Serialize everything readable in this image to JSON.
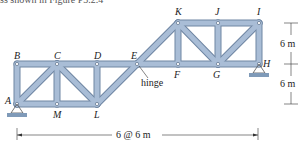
{
  "caption": "ss shown in Figure P3.2.4",
  "nodes": [
    {
      "id": "A",
      "x": 17,
      "y": 104
    },
    {
      "id": "B",
      "x": 17,
      "y": 64
    },
    {
      "id": "C",
      "x": 57,
      "y": 64
    },
    {
      "id": "D",
      "x": 97,
      "y": 64
    },
    {
      "id": "E",
      "x": 137,
      "y": 64
    },
    {
      "id": "F",
      "x": 178,
      "y": 64
    },
    {
      "id": "G",
      "x": 218,
      "y": 64
    },
    {
      "id": "H",
      "x": 259,
      "y": 64
    },
    {
      "id": "I",
      "x": 259,
      "y": 23
    },
    {
      "id": "J",
      "x": 218,
      "y": 23
    },
    {
      "id": "K",
      "x": 178,
      "y": 23
    },
    {
      "id": "L",
      "x": 97,
      "y": 104
    },
    {
      "id": "M",
      "x": 57,
      "y": 104
    }
  ],
  "members": [
    [
      "A",
      "B"
    ],
    [
      "B",
      "C"
    ],
    [
      "C",
      "D"
    ],
    [
      "D",
      "E"
    ],
    [
      "A",
      "M"
    ],
    [
      "M",
      "L"
    ],
    [
      "A",
      "C"
    ],
    [
      "C",
      "M"
    ],
    [
      "C",
      "L"
    ],
    [
      "D",
      "L"
    ],
    [
      "L",
      "E"
    ],
    [
      "E",
      "K"
    ],
    [
      "E",
      "F"
    ],
    [
      "F",
      "G"
    ],
    [
      "G",
      "H"
    ],
    [
      "K",
      "J"
    ],
    [
      "J",
      "I"
    ],
    [
      "K",
      "F"
    ],
    [
      "K",
      "G"
    ],
    [
      "J",
      "G"
    ],
    [
      "G",
      "I"
    ],
    [
      "I",
      "H"
    ]
  ],
  "labels": {
    "A": "A",
    "B": "B",
    "C": "C",
    "D": "D",
    "E": "E",
    "F": "F",
    "G": "G",
    "H": "H",
    "I": "I",
    "J": "J",
    "K": "K",
    "L": "L",
    "M": "M"
  },
  "hinge_label": "hinge",
  "dimensions": {
    "upper": "6 m",
    "lower": "6 m",
    "span": "6 @ 6 m"
  },
  "colors": {
    "member_fill": "#a9bdd6",
    "member_edge": "#6f86a3",
    "support": "#7f9ab8",
    "dim_line": "#333333"
  }
}
